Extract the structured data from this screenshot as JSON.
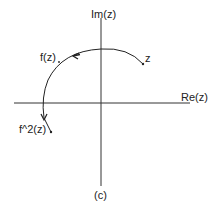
{
  "diagram": {
    "caption": "(c)",
    "axes": {
      "x_label": "Re(z)",
      "y_label": "Im(z)"
    },
    "points": {
      "z_label": "z",
      "fz_label": "f(z)",
      "f2z_label": "f^2(z)"
    },
    "colors": {
      "line": "#222222",
      "axis": "#333333",
      "background": "#ffffff"
    }
  }
}
